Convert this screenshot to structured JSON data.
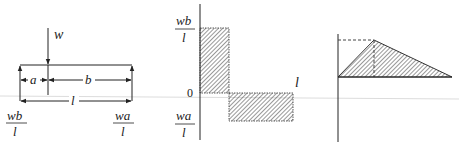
{
  "beam_diagram": {
    "load_label": "w",
    "dim_a": "a",
    "dim_b": "b",
    "dim_l": "l",
    "left_reaction": {
      "num": "wb",
      "den": "l"
    },
    "right_reaction": {
      "num": "wa",
      "den": "l"
    }
  },
  "shear_diagram": {
    "top_value": {
      "num": "wb",
      "den": "l"
    },
    "bottom_value": {
      "num": "wa",
      "den": "l"
    },
    "zero_label": "0",
    "length_label": "l"
  },
  "moment_diagram": {
    "shape": "triangle",
    "peak_at": "a"
  },
  "colors": {
    "line": "#222222",
    "background": "#ffffff",
    "hatch": "#333333"
  }
}
